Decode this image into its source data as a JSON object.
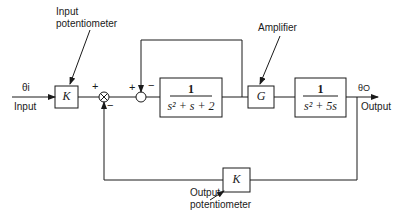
{
  "diagram": {
    "type": "control-system block diagram",
    "input": {
      "symbol": "θi",
      "label": "Input"
    },
    "output": {
      "symbol": "θO",
      "label": "Output"
    },
    "blocks": [
      {
        "id": "input-pot",
        "text": "K",
        "annotation": "Input\npotentiometer",
        "annotation_line1": "Input",
        "annotation_line2": "potentiometer"
      },
      {
        "id": "inner-plant",
        "numerator": "1",
        "denominator": "s² + s + 2"
      },
      {
        "id": "amplifier",
        "text": "G",
        "annotation": "Amplifier"
      },
      {
        "id": "outer-plant",
        "numerator": "1",
        "denominator": "s² + 5s"
      },
      {
        "id": "output-pot",
        "text": "K",
        "annotation_line1": "Output",
        "annotation_line2": "potentiometer"
      }
    ],
    "summing_junctions": [
      {
        "id": "outer-sum",
        "plus": "+",
        "minus": "−"
      },
      {
        "id": "inner-sum",
        "plus": "+",
        "minus": "−"
      }
    ]
  },
  "colors": {
    "line": "#1a1a1a",
    "background": "#ffffff"
  }
}
